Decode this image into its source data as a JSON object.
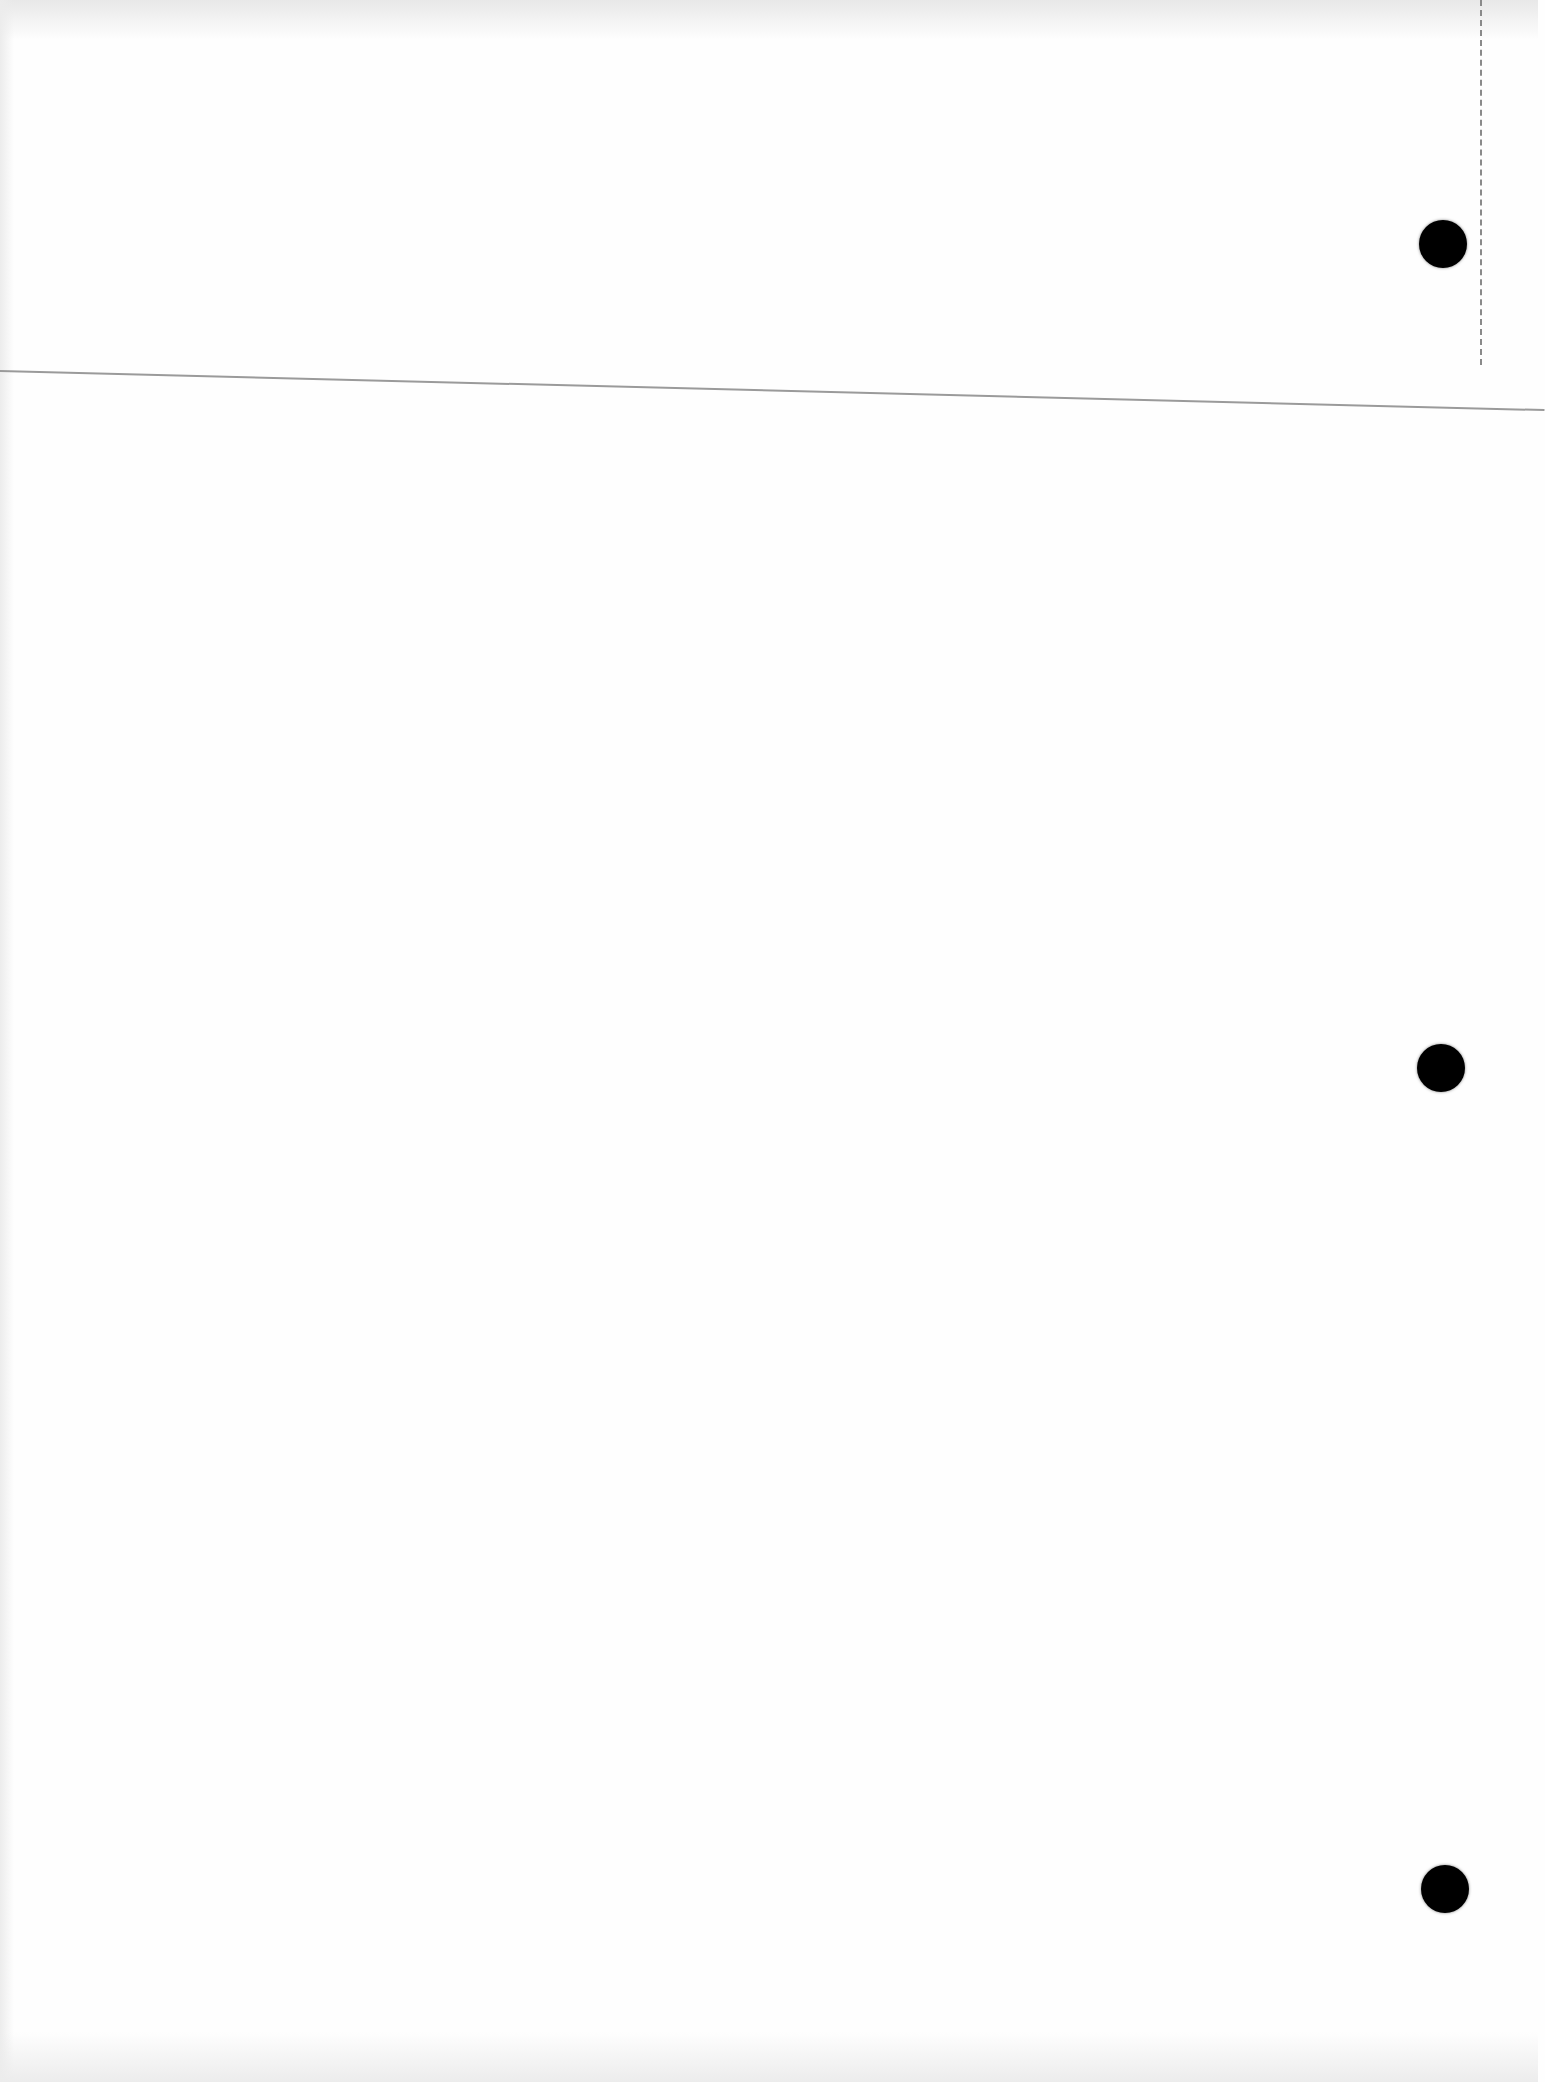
{
  "page": {
    "type": "blank scanned page",
    "text": "",
    "punch_holes": [
      {
        "x": 1443,
        "y": 244
      },
      {
        "x": 1441,
        "y": 1068
      },
      {
        "x": 1445,
        "y": 1889
      }
    ],
    "colors": {
      "paper": "#fefefe",
      "rule": "#9a9a9a",
      "hole": "#000000"
    }
  }
}
